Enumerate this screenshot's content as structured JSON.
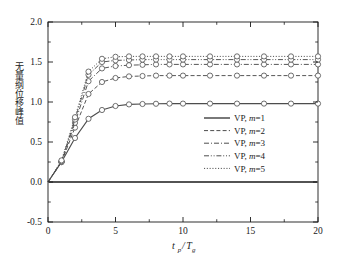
{
  "chart_data": {
    "type": "line",
    "title": "",
    "xlabel": "t_p/T_g",
    "xlabel_parts": {
      "main1": "t",
      "sub1": "p",
      "slash": "/",
      "main2": "T",
      "sub2": "g"
    },
    "ylabel": "无量纲位移峰值",
    "xlim": [
      0,
      20
    ],
    "ylim": [
      -0.5,
      2.0
    ],
    "xticks": [
      "0",
      "5",
      "10",
      "15",
      "20"
    ],
    "xtick_values": [
      0,
      5,
      10,
      15,
      20
    ],
    "yticks": [
      "-0.5",
      "0.0",
      "0.5",
      "1.0",
      "1.5",
      "2.0"
    ],
    "ytick_values": [
      -0.5,
      0.0,
      0.5,
      1.0,
      1.5,
      2.0
    ],
    "minor_ytick_values": [
      -0.25,
      0.25,
      0.75,
      1.25,
      1.75
    ],
    "minor_xtick_values": [
      2.5,
      7.5,
      12.5,
      17.5
    ],
    "grid": false,
    "legend_position": "center-right",
    "zero_reference_line": 0.0,
    "x": [
      0,
      1,
      2,
      3,
      4,
      5,
      6,
      7,
      8,
      9,
      10,
      12,
      14,
      16,
      18,
      20
    ],
    "series": [
      {
        "name": "VP, m=1",
        "linestyle": "solid",
        "marker": "circle",
        "values": [
          0.0,
          0.25,
          0.55,
          0.79,
          0.9,
          0.95,
          0.97,
          0.975,
          0.978,
          0.98,
          0.98,
          0.98,
          0.98,
          0.98,
          0.98,
          0.98
        ]
      },
      {
        "name": "VP, m=2",
        "linestyle": "dashed",
        "marker": "circle",
        "values": [
          0.0,
          0.25,
          0.68,
          1.1,
          1.25,
          1.3,
          1.32,
          1.325,
          1.33,
          1.33,
          1.33,
          1.33,
          1.33,
          1.33,
          1.33,
          1.33
        ]
      },
      {
        "name": "VP, m=3",
        "linestyle": "dashdot",
        "marker": "circle",
        "values": [
          0.0,
          0.25,
          0.74,
          1.26,
          1.42,
          1.45,
          1.46,
          1.465,
          1.47,
          1.47,
          1.47,
          1.47,
          1.47,
          1.47,
          1.47,
          1.47
        ]
      },
      {
        "name": "VP, m=4",
        "linestyle": "dashdotdot",
        "marker": "circle",
        "values": [
          0.0,
          0.26,
          0.78,
          1.34,
          1.5,
          1.52,
          1.525,
          1.53,
          1.53,
          1.53,
          1.53,
          1.53,
          1.53,
          1.53,
          1.53,
          1.53
        ]
      },
      {
        "name": "VP, m=5",
        "linestyle": "dotted",
        "marker": "circle",
        "values": [
          0.0,
          0.27,
          0.81,
          1.38,
          1.54,
          1.565,
          1.57,
          1.57,
          1.57,
          1.57,
          1.57,
          1.57,
          1.57,
          1.57,
          1.57,
          1.57
        ]
      }
    ]
  },
  "legend": {
    "items": [
      {
        "prefix": "VP, ",
        "var": "m",
        "suffix": "=1"
      },
      {
        "prefix": "VP, ",
        "var": "m",
        "suffix": "=2"
      },
      {
        "prefix": "VP, ",
        "var": "m",
        "suffix": "=3"
      },
      {
        "prefix": "VP, ",
        "var": "m",
        "suffix": "=4"
      },
      {
        "prefix": "VP, ",
        "var": "m",
        "suffix": "=5"
      }
    ]
  },
  "colors": {
    "axis": "#1a1a1a",
    "line": "#4d4d4d",
    "marker_face": "#ffffff",
    "zero_line": "#1a1a1a",
    "background": "#ffffff"
  }
}
